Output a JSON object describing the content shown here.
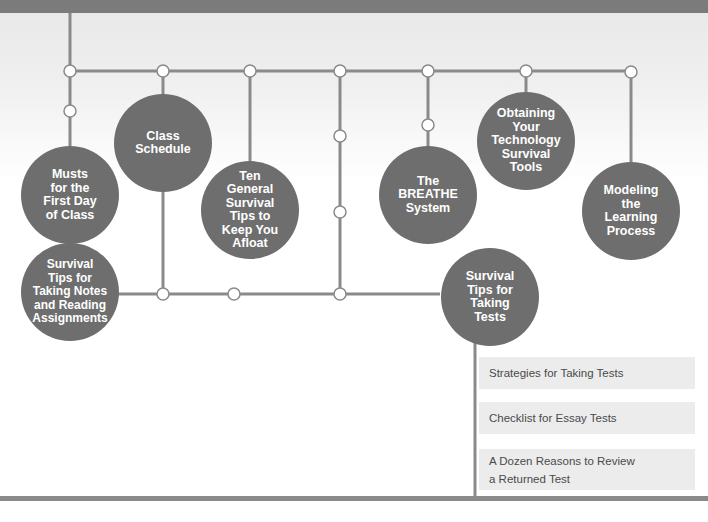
{
  "diagram": {
    "title_bar": "",
    "nodes": [
      {
        "id": "musts",
        "label": "Musts\nfor the\nFirst Day\nof Class"
      },
      {
        "id": "notes",
        "label": "Survival\nTips for\nTaking Notes\nand Reading\nAssignments"
      },
      {
        "id": "schedule",
        "label": "Class\nSchedule"
      },
      {
        "id": "ten-tips",
        "label": "Ten\nGeneral\nSurvival\nTips to\nKeep You\nAfloat"
      },
      {
        "id": "breathe",
        "label": "The\nBREATHE\nSystem"
      },
      {
        "id": "technology",
        "label": "Obtaining\nYour\nTechnology\nSurvival\nTools"
      },
      {
        "id": "modeling",
        "label": "Modeling\nthe\nLearning\nProcess"
      },
      {
        "id": "tests",
        "label": "Survival\nTips for\nTaking\nTests"
      }
    ],
    "test_items": [
      {
        "label": "Strategies for Taking Tests"
      },
      {
        "label": "Checklist for Essay Tests"
      },
      {
        "label": "A Dozen Reasons to Review\na Returned Test"
      }
    ],
    "colors": {
      "circle_fill": "#6e6e6e",
      "line": "#8a8a8a",
      "box_fill": "#ececec",
      "bar": "#7b7b7b"
    }
  }
}
